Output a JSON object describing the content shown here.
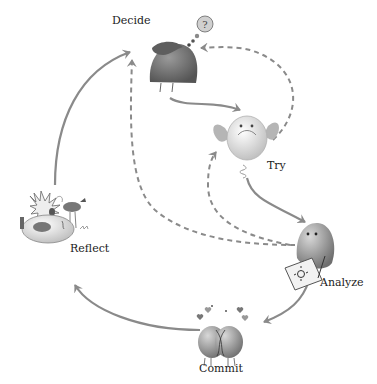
{
  "diagram": {
    "type": "cycle",
    "stages": [
      {
        "id": "decide",
        "label": "Decide",
        "icon": "hooded-blob-with-question-bubble-icon"
      },
      {
        "id": "try",
        "label": "Try",
        "icon": "winged-egg-on-spring-icon"
      },
      {
        "id": "analyze",
        "label": "Analyze",
        "icon": "blob-drawing-on-paper-icon"
      },
      {
        "id": "commit",
        "label": "Commit",
        "icon": "two-hugging-blobs-with-hearts-icon"
      },
      {
        "id": "reflect",
        "label": "Reflect",
        "icon": "lying-blob-with-spiky-thought-and-bird-icon"
      }
    ],
    "edges": [
      {
        "from": "decide",
        "to": "try",
        "style": "solid"
      },
      {
        "from": "try",
        "to": "analyze",
        "style": "solid"
      },
      {
        "from": "analyze",
        "to": "commit",
        "style": "solid"
      },
      {
        "from": "commit",
        "to": "reflect",
        "style": "solid"
      },
      {
        "from": "reflect",
        "to": "decide",
        "style": "solid"
      },
      {
        "from": "try",
        "to": "decide",
        "style": "dashed"
      },
      {
        "from": "analyze",
        "to": "decide",
        "style": "dashed"
      },
      {
        "from": "analyze",
        "to": "try",
        "style": "dashed"
      }
    ],
    "colors": {
      "arrow": "#8a8a8a",
      "decide_body": "#6e6e6e",
      "figure_light": "#e4e4e4",
      "figure_mid": "#a8a8a8",
      "text": "#222222"
    }
  }
}
